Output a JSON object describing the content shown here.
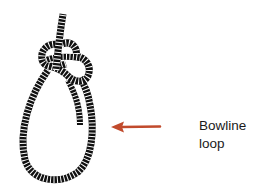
{
  "diagram": {
    "label_line1": "Bowline",
    "label_line2": "loop",
    "arrow_color": "#c14a2c",
    "rope_color": "#111111",
    "rope_stripe_color": "#ffffff"
  }
}
